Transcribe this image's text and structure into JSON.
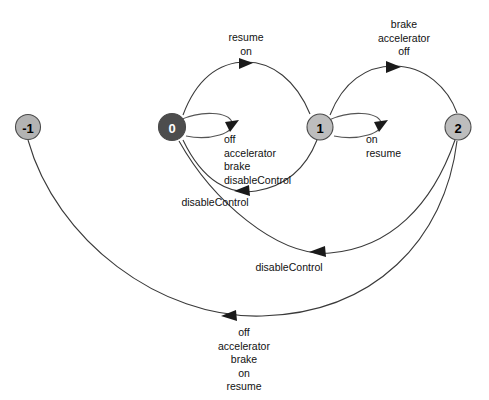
{
  "diagram": {
    "type": "state-transition-diagram",
    "background_color": "#ffffff",
    "edge_color": "#3a3a3a",
    "nodes": [
      {
        "id": "n-1",
        "label": "-1",
        "cx": 28,
        "cy": 127,
        "r": 12.5,
        "fill": "#b3b3b3",
        "text_color": "#000000"
      },
      {
        "id": "n0",
        "label": "0",
        "cx": 172,
        "cy": 127,
        "r": 13.5,
        "fill": "#4d4d4d",
        "text_color": "#ffffff"
      },
      {
        "id": "n1",
        "label": "1",
        "cx": 320,
        "cy": 127,
        "r": 13,
        "fill": "#bdbdbd",
        "text_color": "#000000"
      },
      {
        "id": "n2",
        "label": "2",
        "cx": 458,
        "cy": 127,
        "r": 13,
        "fill": "#bdbdbd",
        "text_color": "#000000"
      }
    ],
    "edges": [
      {
        "id": "e-0-1",
        "from": "0",
        "to": "1",
        "label": "resume\non",
        "label_x": 246,
        "label_y": 31,
        "label_align": "center"
      },
      {
        "id": "e-1-2",
        "from": "1",
        "to": "2",
        "label": "brake\naccelerator\noff",
        "label_x": 404,
        "label_y": 18,
        "label_align": "center"
      },
      {
        "id": "e-0-self",
        "from": "0",
        "to": "0",
        "label": "off\naccelerator\nbrake\ndisableControl",
        "label_x": 224,
        "label_y": 133,
        "label_align": "left"
      },
      {
        "id": "e-1-self",
        "from": "1",
        "to": "1",
        "label": "on\nresume",
        "label_x": 366,
        "label_y": 133,
        "label_align": "left"
      },
      {
        "id": "e-1-0",
        "from": "1",
        "to": "0",
        "label": "disableControl",
        "label_x": 215,
        "label_y": 196,
        "label_align": "center"
      },
      {
        "id": "e-2-0",
        "from": "2",
        "to": "0",
        "label": "disableControl",
        "label_x": 289,
        "label_y": 261,
        "label_align": "center"
      },
      {
        "id": "e-2-minus1",
        "from": "2",
        "to": "-1",
        "label": "off\naccelerator\nbrake\non\nresume",
        "label_x": 244,
        "label_y": 326,
        "label_align": "center"
      }
    ]
  }
}
